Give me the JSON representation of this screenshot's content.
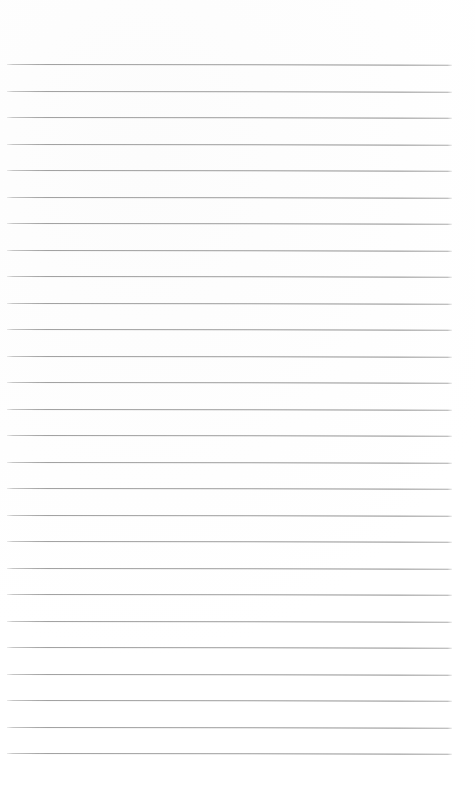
{
  "document": {
    "kind": "lined-notepad-page",
    "title": "Blank Ruled Notepad Page",
    "page_text": "",
    "header_text": "",
    "footer_text": "",
    "has_handwriting": false,
    "has_printed_text": false
  },
  "page": {
    "width_px": 475,
    "height_px": 792,
    "background_color": "#ffffff",
    "paper_tone_color": "#fcfcfc"
  },
  "ruling": {
    "line_color": "#9a9a9a",
    "line_thickness_px": 1,
    "line_count": 27,
    "first_line_y_px": 64,
    "last_line_y_px": 753,
    "line_spacing_px": 26.5,
    "left_margin_px": 7,
    "right_margin_px": 23,
    "line_length_px": 445,
    "slant_degrees": 0.085,
    "lines_y_px": [
      64,
      90.5,
      117,
      143.5,
      170,
      196.5,
      223,
      249.5,
      276,
      302.5,
      329,
      355.5,
      382,
      408.5,
      435,
      461.5,
      488,
      514.5,
      541,
      567.5,
      594,
      620.5,
      647,
      673.5,
      700,
      726.5,
      753
    ]
  },
  "zones": {
    "header_label": "",
    "footer_label": ""
  }
}
